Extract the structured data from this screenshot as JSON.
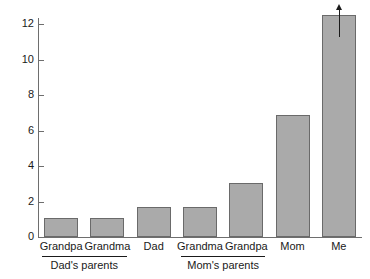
{
  "chart_data": {
    "type": "bar",
    "title": "",
    "subtitle": "",
    "xlabel": "",
    "ylabel": "",
    "categories": [
      "Grandpa",
      "Grandma",
      "Dad",
      "Grandma",
      "Grandpa",
      "Mom",
      "Me"
    ],
    "values": [
      1.05,
      1.05,
      1.7,
      1.7,
      3.05,
      6.85,
      12.5
    ],
    "ylim": [
      0,
      13.3
    ],
    "y_ticks": [
      0,
      2,
      4,
      6,
      8,
      10,
      12
    ],
    "y_tick_labels": [
      "0",
      "2",
      "4",
      "6",
      "8",
      "10",
      "12"
    ],
    "grid": false,
    "legend": null,
    "bar_color": "#aaaaaa",
    "bar_border_color": "#6a6a6a",
    "axis_color": "#6e6e6e",
    "text_color": "#1a1a1a",
    "annotations": [
      {
        "type": "arrow-up",
        "target_category": "Me",
        "note": "upward arrow at top of tallest bar indicating value continues beyond"
      }
    ],
    "groups": [
      {
        "label": "Dad's parents",
        "members": [
          "Grandpa",
          "Grandma"
        ],
        "start_index": 0,
        "end_index": 1
      },
      {
        "label": "Mom's parents",
        "members": [
          "Grandma",
          "Grandpa"
        ],
        "start_index": 3,
        "end_index": 4
      }
    ]
  }
}
